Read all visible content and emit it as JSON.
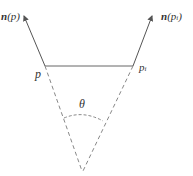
{
  "diagram": {
    "labels": {
      "normal_p_bold": "n",
      "normal_p_arg": "(p)",
      "normal_pi_bold": "n",
      "normal_pi_arg_open": "(p",
      "normal_pi_sub": "i",
      "normal_pi_arg_close": ")",
      "point_p": "p",
      "point_pi": "p",
      "point_pi_sub": "i",
      "angle": "θ"
    },
    "colors": {
      "line": "#555555",
      "dashed": "#888888",
      "text": "#333333"
    }
  }
}
